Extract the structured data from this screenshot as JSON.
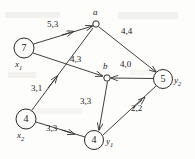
{
  "figure": {
    "kind": "flow-network-diagram",
    "width": 195,
    "height": 159,
    "stroke_color": "#2b2926",
    "background": "#fdfdfb"
  },
  "nodes": [
    {
      "id": "x1",
      "style": "circle",
      "value": "7",
      "name": "x",
      "sub": "1",
      "cx": 24,
      "cy": 48,
      "r": 10,
      "label_dx": -8,
      "label_dy": 12
    },
    {
      "id": "x2",
      "style": "circle",
      "value": "4",
      "name": "x",
      "sub": "2",
      "cx": 26,
      "cy": 119,
      "r": 10,
      "label_dx": -8,
      "label_dy": 12
    },
    {
      "id": "a",
      "style": "point",
      "value": "",
      "name": "a",
      "sub": "",
      "cx": 96,
      "cy": 24,
      "r": 3.2,
      "label_dx": -2,
      "label_dy": -16
    },
    {
      "id": "b",
      "style": "point",
      "value": "",
      "name": "b",
      "sub": "",
      "cx": 107,
      "cy": 78,
      "r": 3.2,
      "label_dx": -3,
      "label_dy": -16
    },
    {
      "id": "y2",
      "style": "circle",
      "value": "5",
      "name": "y",
      "sub": "2",
      "cx": 163,
      "cy": 79,
      "r": 9.5,
      "label_dx": 10,
      "label_dy": -2
    },
    {
      "id": "y1",
      "style": "circle",
      "value": "4",
      "name": "y",
      "sub": "1",
      "cx": 94,
      "cy": 140,
      "r": 9.5,
      "label_dx": 10,
      "label_dy": -2
    }
  ],
  "edges": [
    {
      "id": "x1-a",
      "from": "x1",
      "to": "a",
      "label": "5,3",
      "label_x": 47,
      "label_y": 24
    },
    {
      "id": "x1-b",
      "from": "x1",
      "to": "b",
      "label": "4,3",
      "label_x": 70,
      "label_y": 59
    },
    {
      "id": "x2-a",
      "from": "x2",
      "to": "a",
      "label": "3,1",
      "label_x": 31,
      "label_y": 87
    },
    {
      "id": "x2-y1",
      "from": "x2",
      "to": "y1",
      "label": "3,3",
      "label_x": 46,
      "label_y": 127
    },
    {
      "id": "a-y2",
      "from": "a",
      "to": "y2",
      "label": "4,4",
      "label_x": 121,
      "label_y": 30
    },
    {
      "id": "y2-b",
      "from": "y2",
      "to": "b",
      "label": "4,0",
      "label_x": 120,
      "label_y": 63
    },
    {
      "id": "b-y1",
      "from": "b",
      "to": "y1",
      "label": "3,3",
      "label_x": 80,
      "label_y": 100
    },
    {
      "id": "y1-y2",
      "from": "y1",
      "to": "y2",
      "label": "2,2",
      "label_x": 131,
      "label_y": 107
    }
  ]
}
